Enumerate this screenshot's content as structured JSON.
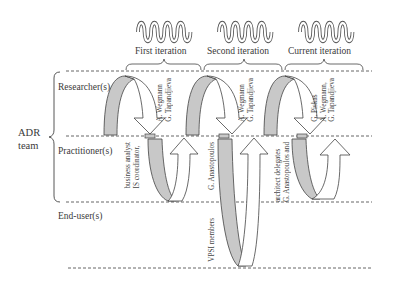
{
  "diagram": {
    "group_label": "ADR\nteam",
    "group_label_line1": "ADR",
    "group_label_line2": "team",
    "roles": [
      {
        "label": "Researcher(s)"
      },
      {
        "label": "Practitioner(s)"
      },
      {
        "label": "End-user(s)"
      }
    ],
    "iterations": [
      {
        "label": "First iteration",
        "researchers": [
          "G. Tapandjieva",
          "A. Wegmann"
        ],
        "practitioners": [
          "IS coordinator,",
          "business analyst"
        ]
      },
      {
        "label": "Second iteration",
        "researchers": [
          "G. Tapandjieva",
          "A. Wegmann"
        ],
        "practitioners": [
          "G. Anastopoulos"
        ],
        "end_users": [
          "VPSI members"
        ]
      },
      {
        "label": "Current iteration",
        "researchers": [
          "G. Tapandjieva",
          "A. Wegmann,",
          "G. Piskas"
        ],
        "practitioners": [
          "G. Anastopoulos and",
          "architect delegates"
        ]
      }
    ],
    "colors": {
      "shaded_arrow": "#c8c8c8",
      "outline": "#444444",
      "dashed_line": "#555555"
    }
  }
}
